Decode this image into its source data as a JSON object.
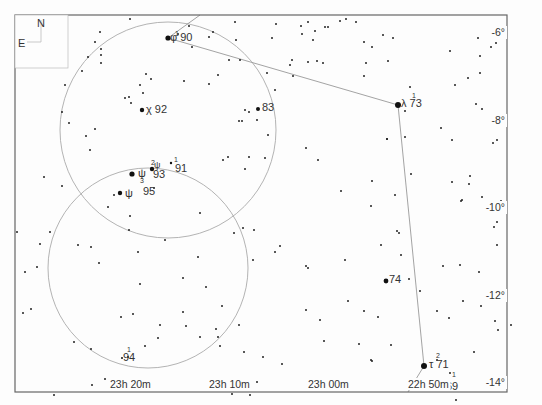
{
  "chart_data": {
    "type": "star-chart",
    "frame": {
      "x": 15,
      "y": 15,
      "width": 492,
      "height": 377
    },
    "compass": {
      "north": "N",
      "east": "E"
    },
    "ra_labels": [
      {
        "text": "23h 20m",
        "x": 110,
        "y": 388
      },
      {
        "text": "23h 10m",
        "x": 209,
        "y": 388
      },
      {
        "text": "23h 00m",
        "x": 308,
        "y": 388
      },
      {
        "text": "22h 50m",
        "x": 408,
        "y": 388
      }
    ],
    "dec_labels": [
      {
        "text": "-6°",
        "x": 505,
        "y": 36
      },
      {
        "text": "-8°",
        "x": 505,
        "y": 124
      },
      {
        "text": "-10°",
        "x": 505,
        "y": 211
      },
      {
        "text": "-12°",
        "x": 505,
        "y": 299
      },
      {
        "text": "-14°",
        "x": 505,
        "y": 386
      }
    ],
    "circles": [
      {
        "cx": 168,
        "cy": 130,
        "r": 108
      },
      {
        "cx": 148,
        "cy": 268,
        "r": 100
      }
    ],
    "constellation_lines": [
      [
        [
          200,
          15
        ],
        [
          168,
          38
        ]
      ],
      [
        [
          168,
          38
        ],
        [
          398,
          105
        ]
      ],
      [
        [
          398,
          105
        ],
        [
          424,
          366
        ]
      ],
      [
        [
          424,
          366
        ],
        [
          408,
          392
        ]
      ]
    ],
    "named_stars": [
      {
        "x": 168,
        "y": 38,
        "r": 2.6,
        "label": "φ 90",
        "lx": 170,
        "ly": 37
      },
      {
        "x": 142,
        "y": 110,
        "r": 2.2,
        "label": "χ 92",
        "lx": 146,
        "ly": 109
      },
      {
        "x": 258,
        "y": 109,
        "r": 2.0,
        "label": "83",
        "lx": 262,
        "ly": 107
      },
      {
        "x": 398,
        "y": 105,
        "r": 3.0,
        "label": "λ 73",
        "lx": 401,
        "ly": 103
      },
      {
        "x": 132,
        "y": 174,
        "r": 2.6,
        "label": "ψ",
        "lx": 138,
        "ly": 173
      },
      {
        "x": 152,
        "y": 169,
        "r": 2.2,
        "label": "93",
        "lx": 153,
        "ly": 174
      },
      {
        "x": 171,
        "y": 163,
        "r": 1.2,
        "label": "91",
        "lx": 175,
        "ly": 168
      },
      {
        "x": 120,
        "y": 193,
        "r": 2.2,
        "label": "ψ",
        "lx": 125,
        "ly": 193
      },
      {
        "x": 120,
        "y": 193,
        "r": 0,
        "label": "95",
        "lx": 143,
        "ly": 191
      },
      {
        "x": 386,
        "y": 281,
        "r": 2.4,
        "label": "74",
        "lx": 389,
        "ly": 279
      },
      {
        "x": 424,
        "y": 366,
        "r": 3.0,
        "label": "τ 71",
        "lx": 429,
        "ly": 364
      },
      {
        "x": 122,
        "y": 358,
        "r": 1.0,
        "label": "94",
        "lx": 123,
        "ly": 357
      },
      {
        "x": 455,
        "y": 385,
        "r": 0,
        "label": "69",
        "lx": 446,
        "ly": 386
      }
    ],
    "superscripts": [
      {
        "text": "1",
        "x": 175,
        "y": 36
      },
      {
        "text": "1",
        "x": 412,
        "y": 98
      },
      {
        "text": "2",
        "x": 151,
        "y": 165
      },
      {
        "text": "1",
        "x": 174,
        "y": 162
      },
      {
        "text": "3",
        "x": 140,
        "y": 183
      },
      {
        "text": "2",
        "x": 436,
        "y": 358
      },
      {
        "text": "1",
        "x": 452,
        "y": 377
      },
      {
        "text": "1",
        "x": 127,
        "y": 352
      }
    ],
    "greek_extra": [
      {
        "text": "ψ",
        "x": 154,
        "y": 168
      }
    ],
    "stars": [
      [
        130,
        19
      ],
      [
        100,
        32
      ],
      [
        95,
        42
      ],
      [
        101,
        49
      ],
      [
        88,
        57
      ],
      [
        82,
        71
      ],
      [
        101,
        63
      ],
      [
        101,
        55
      ],
      [
        65,
        85
      ],
      [
        62,
        112
      ],
      [
        69,
        123
      ],
      [
        95,
        129
      ],
      [
        90,
        150
      ],
      [
        86,
        136
      ],
      [
        44,
        177
      ],
      [
        146,
        74
      ],
      [
        140,
        85
      ],
      [
        129,
        97
      ],
      [
        125,
        98
      ],
      [
        131,
        103
      ],
      [
        151,
        79
      ],
      [
        143,
        93
      ],
      [
        178,
        34
      ],
      [
        189,
        26
      ],
      [
        192,
        47
      ],
      [
        213,
        32
      ],
      [
        209,
        37
      ],
      [
        184,
        81
      ],
      [
        209,
        84
      ],
      [
        218,
        75
      ],
      [
        229,
        60
      ],
      [
        240,
        60
      ],
      [
        245,
        110
      ],
      [
        268,
        135
      ],
      [
        242,
        121
      ],
      [
        257,
        120
      ],
      [
        249,
        112
      ],
      [
        267,
        73
      ],
      [
        239,
        121
      ],
      [
        275,
        90
      ],
      [
        249,
        157
      ],
      [
        265,
        158
      ],
      [
        228,
        157
      ],
      [
        223,
        160
      ],
      [
        245,
        169
      ],
      [
        235,
        22
      ],
      [
        236,
        40
      ],
      [
        276,
        24
      ],
      [
        272,
        38
      ],
      [
        292,
        60
      ],
      [
        290,
        65
      ],
      [
        293,
        76
      ],
      [
        301,
        26
      ],
      [
        308,
        22
      ],
      [
        302,
        34
      ],
      [
        325,
        27
      ],
      [
        328,
        27
      ],
      [
        340,
        21
      ],
      [
        346,
        19
      ],
      [
        313,
        40
      ],
      [
        323,
        63
      ],
      [
        317,
        61
      ],
      [
        315,
        31
      ],
      [
        308,
        62
      ],
      [
        356,
        22
      ],
      [
        364,
        42
      ],
      [
        372,
        47
      ],
      [
        366,
        63
      ],
      [
        364,
        76
      ],
      [
        383,
        35
      ],
      [
        388,
        61
      ],
      [
        393,
        38
      ],
      [
        410,
        87
      ],
      [
        405,
        111
      ],
      [
        450,
        51
      ],
      [
        478,
        38
      ],
      [
        480,
        56
      ],
      [
        480,
        73
      ],
      [
        491,
        47
      ],
      [
        496,
        43
      ],
      [
        468,
        78
      ],
      [
        455,
        85
      ],
      [
        476,
        104
      ],
      [
        482,
        109
      ],
      [
        441,
        128
      ],
      [
        452,
        140
      ],
      [
        497,
        140
      ],
      [
        493,
        143
      ],
      [
        470,
        176
      ],
      [
        462,
        200
      ],
      [
        501,
        201
      ],
      [
        482,
        197
      ],
      [
        497,
        212
      ],
      [
        497,
        222
      ],
      [
        497,
        245
      ],
      [
        494,
        227
      ],
      [
        405,
        137
      ],
      [
        397,
        231
      ],
      [
        452,
        182
      ],
      [
        461,
        201
      ],
      [
        469,
        184
      ],
      [
        372,
        181
      ],
      [
        371,
        206
      ],
      [
        387,
        139
      ],
      [
        395,
        195
      ],
      [
        411,
        174
      ],
      [
        381,
        245
      ],
      [
        348,
        301
      ],
      [
        443,
        266
      ],
      [
        460,
        265
      ],
      [
        479,
        272
      ],
      [
        493,
        296
      ],
      [
        481,
        306
      ],
      [
        498,
        330
      ],
      [
        511,
        325
      ],
      [
        495,
        321
      ],
      [
        437,
        360
      ],
      [
        372,
        361
      ],
      [
        345,
        260
      ],
      [
        341,
        191
      ],
      [
        318,
        160
      ],
      [
        306,
        148
      ],
      [
        387,
        139
      ],
      [
        130,
        216
      ],
      [
        108,
        207
      ],
      [
        114,
        195
      ],
      [
        154,
        188
      ],
      [
        165,
        240
      ],
      [
        99,
        263
      ],
      [
        129,
        230
      ],
      [
        138,
        252
      ],
      [
        140,
        284
      ],
      [
        133,
        314
      ],
      [
        121,
        317
      ],
      [
        160,
        325
      ],
      [
        183,
        312
      ],
      [
        158,
        338
      ],
      [
        128,
        357
      ],
      [
        145,
        346
      ],
      [
        105,
        379
      ],
      [
        92,
        385
      ],
      [
        54,
        395
      ],
      [
        74,
        342
      ],
      [
        91,
        349
      ],
      [
        37,
        267
      ],
      [
        25,
        272
      ],
      [
        40,
        244
      ],
      [
        50,
        232
      ],
      [
        31,
        309
      ],
      [
        23,
        313
      ],
      [
        17,
        232
      ],
      [
        78,
        245
      ],
      [
        91,
        247
      ],
      [
        62,
        186
      ],
      [
        200,
        213
      ],
      [
        234,
        233
      ],
      [
        243,
        228
      ],
      [
        254,
        230
      ],
      [
        253,
        260
      ],
      [
        198,
        257
      ],
      [
        183,
        278
      ],
      [
        206,
        287
      ],
      [
        222,
        306
      ],
      [
        244,
        352
      ],
      [
        257,
        382
      ],
      [
        232,
        394
      ],
      [
        250,
        395
      ],
      [
        239,
        325
      ],
      [
        263,
        357
      ],
      [
        186,
        326
      ],
      [
        200,
        337
      ],
      [
        220,
        346
      ],
      [
        218,
        337
      ],
      [
        216,
        329
      ],
      [
        306,
        266
      ],
      [
        308,
        268
      ],
      [
        275,
        252
      ],
      [
        280,
        246
      ],
      [
        320,
        320
      ],
      [
        364,
        311
      ],
      [
        378,
        317
      ],
      [
        371,
        360
      ],
      [
        391,
        345
      ],
      [
        401,
        255
      ],
      [
        409,
        279
      ],
      [
        399,
        233
      ],
      [
        420,
        291
      ],
      [
        437,
        311
      ],
      [
        449,
        318
      ],
      [
        463,
        301
      ],
      [
        474,
        352
      ],
      [
        428,
        386
      ],
      [
        450,
        373
      ],
      [
        456,
        400
      ],
      [
        411,
        384
      ],
      [
        324,
        341
      ],
      [
        282,
        364
      ],
      [
        359,
        344
      ],
      [
        306,
        310
      ]
    ]
  }
}
